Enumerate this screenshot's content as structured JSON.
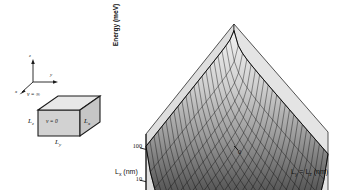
{
  "figure": {
    "type": "two-panel scientific figure",
    "panels": [
      "quantum-box-schematic",
      "energy-surface-3d-plot"
    ]
  },
  "schematic": {
    "triad": {
      "z_label": "z",
      "y_label": "y",
      "x_label": "x"
    },
    "potential_outside": "v = ∞",
    "potential_inside": "v = 0",
    "edge_labels": {
      "left": "L",
      "left_sub": "z",
      "right": "L",
      "right_sub": "x",
      "bottom": "L",
      "bottom_sub": "y"
    },
    "colors": {
      "face_front": "#d4d4d4",
      "face_top": "#e6e6e6",
      "face_side": "#c9c9c9",
      "outline": "#1a1a1a"
    }
  },
  "chart_data": {
    "type": "surface",
    "title": "",
    "zlabel": "Energy (meV)",
    "xlabel": "L",
    "xlabel_sub": "x",
    "xlabel_unit": " (nm)",
    "xlabel_full": "Lₓ (nm)",
    "ylabel_full": "Lᵧ = Lᶻ (nm)",
    "ylabel_parts": {
      "a": "L",
      "a_sub": "y",
      "eq": " = ",
      "b": "L",
      "b_sub": "z",
      "unit": " (nm)"
    },
    "zscale": "log",
    "zticks": [
      "100",
      "10",
      "1",
      "0.1",
      "0"
    ],
    "zvalues": [
      100,
      10,
      1,
      0.1,
      0
    ],
    "xticks": [
      "50",
      "100"
    ],
    "xvalues": [
      50,
      100
    ],
    "yticks": [
      "0",
      "50",
      "100"
    ],
    "yvalues": [
      0,
      50,
      100
    ],
    "xlim": [
      0,
      100
    ],
    "ylim": [
      0,
      100
    ],
    "zlim": [
      0,
      100
    ],
    "grid": true,
    "mesh": true,
    "legend": "none",
    "surface_shading": {
      "high": "#f0f0f0",
      "mid": "#8a8a8a",
      "low": "#141414"
    },
    "wall_color": "#dedede",
    "floor_color": "#ededed",
    "mesh_color": "#0d0d0d",
    "grid_nx": 22,
    "grid_ny": 22
  }
}
